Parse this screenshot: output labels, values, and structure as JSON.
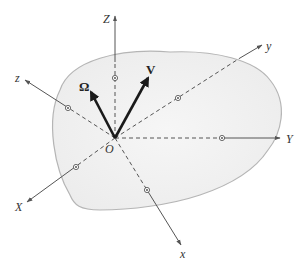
{
  "diagram": {
    "title": "",
    "labels": {
      "Z": "Z",
      "Y": "Y",
      "X": "X",
      "z": "z",
      "y": "y",
      "x": "x",
      "origin": "O",
      "omega": "Ω",
      "velocity": "V"
    },
    "colors": {
      "body_fill": "#f1f1f1",
      "body_edge": "#9a9a9a",
      "axis": "#555555",
      "vector": "#1a1a1a"
    },
    "axes_fixed": [
      "X",
      "Y",
      "Z"
    ],
    "axes_body": [
      "x",
      "y",
      "z"
    ],
    "vectors": [
      "Ω",
      "V"
    ]
  }
}
